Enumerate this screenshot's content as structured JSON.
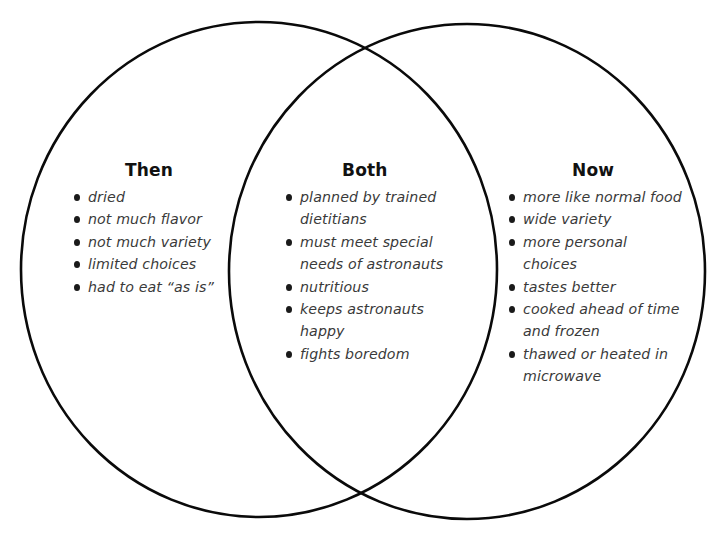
{
  "diagram": {
    "type": "venn",
    "circle_stroke_color": "#0a0a0a",
    "text_color": "#3a3a3a",
    "title_color": "#111111",
    "background": "#ffffff"
  },
  "left": {
    "title": "Then",
    "items": [
      "dried",
      "not much flavor",
      "not much variety",
      "limited choices",
      "had to eat “as is”"
    ]
  },
  "center": {
    "title": "Both",
    "items": [
      "planned by trained dietitians",
      "must meet special needs of astronauts",
      "nutritious",
      "keeps astronauts happy",
      "fights boredom"
    ]
  },
  "right": {
    "title": "Now",
    "items": [
      "more like normal food",
      "wide variety",
      "more personal choices",
      "tastes better",
      "cooked ahead of time and frozen",
      "thawed or heated in microwave"
    ]
  }
}
